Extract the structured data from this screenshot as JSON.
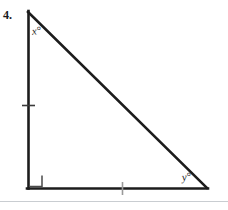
{
  "page": {
    "background_color": "#ffffff",
    "width": 228,
    "height": 210,
    "kind": "textbook-geometry-figure"
  },
  "problem": {
    "number_label": "4."
  },
  "figure": {
    "shape": "right triangle",
    "stroke_color": "#1c1c1c",
    "stroke_width": 2.6,
    "vertices": {
      "apex": {
        "x": 28,
        "y": 12
      },
      "right_angle": {
        "x": 28,
        "y": 188
      },
      "base_right": {
        "x": 207,
        "y": 188
      }
    },
    "sides": [
      {
        "name": "vertical-leg",
        "from": "apex",
        "to": "right_angle",
        "tick_marks": 1
      },
      {
        "name": "horizontal-leg",
        "from": "right_angle",
        "to": "base_right",
        "tick_marks": 1
      },
      {
        "name": "hypotenuse",
        "from": "apex",
        "to": "base_right",
        "tick_marks": 0
      }
    ],
    "right_angle_marker": {
      "at": "right_angle",
      "size": 12,
      "color": "#4a4a4a"
    },
    "tick_marks": [
      {
        "side": "vertical-leg",
        "cx": 28,
        "cy": 105,
        "length": 13,
        "orientation": "horizontal",
        "color": "#3b3b3b"
      },
      {
        "side": "horizontal-leg",
        "cx": 122,
        "cy": 188,
        "length": 13,
        "orientation": "vertical",
        "color": "#9a9a9a"
      }
    ]
  },
  "labels": {
    "angle_x": "x°",
    "angle_y": "y°"
  },
  "artifacts": {
    "scan_line_color": "#c9cdd1"
  }
}
